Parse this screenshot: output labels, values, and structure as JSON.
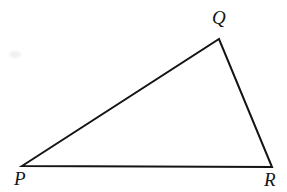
{
  "figure": {
    "kind": "geometry-diagram",
    "shape_name": "triangle",
    "canvas": {
      "width": 287,
      "height": 192
    },
    "background_color": "#ffffff",
    "stroke_color": "#141414",
    "stroke_width": 2,
    "vertices": [
      {
        "id": "P",
        "label": "P",
        "x": 22,
        "y": 166,
        "label_x": 14,
        "label_y": 169
      },
      {
        "id": "Q",
        "label": "Q",
        "x": 219,
        "y": 39,
        "label_x": 212,
        "label_y": 8
      },
      {
        "id": "R",
        "label": "R",
        "x": 272,
        "y": 167,
        "label_x": 264,
        "label_y": 170
      }
    ],
    "edges": [
      {
        "id": "PQ",
        "from": "P",
        "to": "Q"
      },
      {
        "id": "QR",
        "from": "Q",
        "to": "R"
      },
      {
        "id": "RP",
        "from": "R",
        "to": "P"
      }
    ],
    "polygon_points": "22,166 219,39 272,167",
    "artifacts": [
      {
        "id": "scan-smudge",
        "x": 9,
        "y": 51,
        "width": 12,
        "height": 7,
        "color": "#f1f1f1"
      }
    ]
  }
}
